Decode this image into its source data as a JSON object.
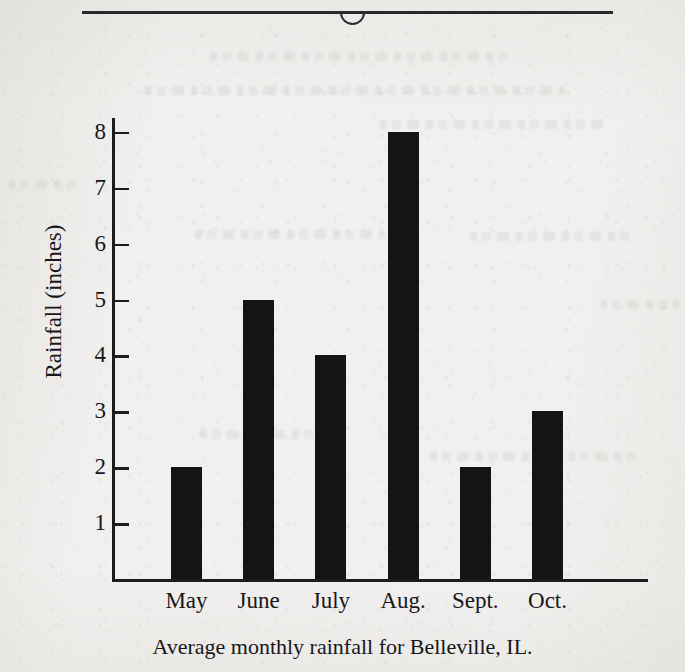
{
  "page": {
    "background_color": "#f1f0ee",
    "ink_color": "#141414"
  },
  "header_rule": {
    "name": "horizontal-rule-with-notch",
    "notch_shape": "semicircle-down"
  },
  "chart_data": {
    "type": "bar",
    "title": "",
    "caption": "Average monthly rainfall for Belleville, IL.",
    "categories": [
      "May",
      "June",
      "July",
      "Aug.",
      "Sept.",
      "Oct."
    ],
    "values": [
      2,
      5,
      4,
      8,
      2,
      3
    ],
    "xlabel": "",
    "ylabel": "Rainfall (inches)",
    "ylim": [
      0,
      8.3
    ],
    "yticks": [
      1,
      2,
      3,
      4,
      5,
      6,
      7,
      8
    ],
    "ytick_labels": [
      "1",
      "2",
      "3",
      "4",
      "5",
      "6",
      "7",
      "8"
    ],
    "grid": false,
    "legend": false,
    "bar_color": "#141414",
    "units": "inches"
  }
}
